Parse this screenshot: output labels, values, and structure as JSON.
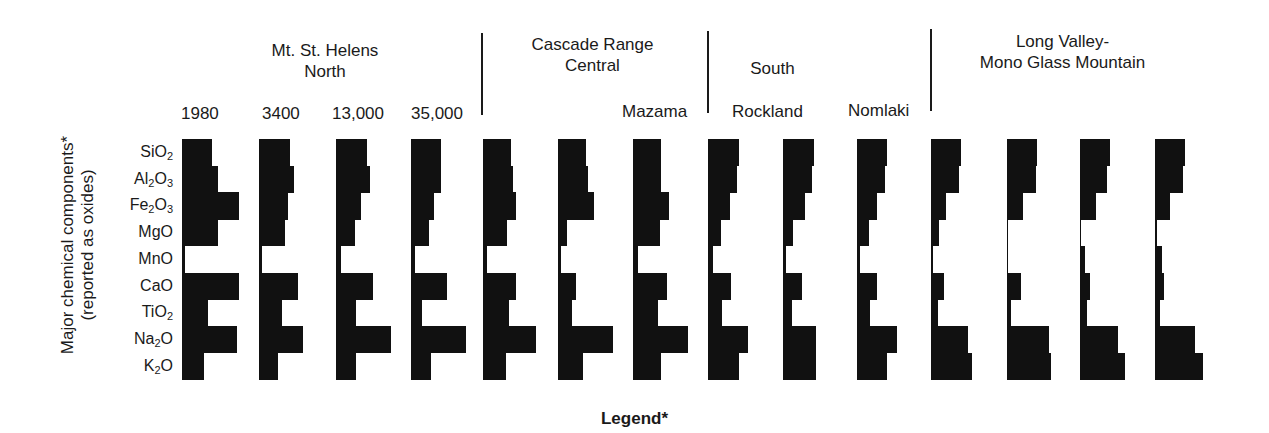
{
  "chart_data": {
    "type": "bar",
    "subtype": "profile-glyphs (horizontal bars per sample)",
    "title": "",
    "ylabel": "Major chemical components* (reported as oxides)",
    "legend_title": "Legend*",
    "categories": [
      "SiO2",
      "Al2O3",
      "Fe2O3",
      "MgO",
      "MnO",
      "CaO",
      "TiO2",
      "Na2O",
      "K2O"
    ],
    "category_labels": [
      {
        "base": "SiO",
        "sub": "2",
        "tail": ""
      },
      {
        "base": "Al",
        "sub": "2",
        "tail": "O3"
      },
      {
        "base": "Fe",
        "sub": "2",
        "tail": "O3"
      },
      {
        "base": "MgO",
        "sub": "",
        "tail": ""
      },
      {
        "base": "MnO",
        "sub": "",
        "tail": ""
      },
      {
        "base": "CaO",
        "sub": "",
        "tail": ""
      },
      {
        "base": "TiO",
        "sub": "2",
        "tail": ""
      },
      {
        "base": "Na",
        "sub": "2",
        "tail": "O"
      },
      {
        "base": "K",
        "sub": "2",
        "tail": "O"
      }
    ],
    "units": "relative bar length (px, unlabeled scale)",
    "groups": [
      {
        "name": "Mt. St. Helens\nNorth",
        "samples": [
          0,
          1,
          2,
          3
        ]
      },
      {
        "name": "Cascade Range\nCentral",
        "samples": [
          4,
          5,
          6
        ]
      },
      {
        "name": "South",
        "samples": [
          7,
          8,
          9
        ]
      },
      {
        "name": "Long Valley-\nMono Glass Mountain",
        "samples": [
          10,
          11,
          12,
          13
        ]
      }
    ],
    "series": [
      {
        "name": "1980",
        "values": [
          30,
          36,
          57,
          36,
          3,
          57,
          26,
          55,
          22
        ]
      },
      {
        "name": "3400",
        "values": [
          31,
          35,
          29,
          26,
          3,
          39,
          23,
          44,
          19
        ]
      },
      {
        "name": "13,000",
        "values": [
          31,
          34,
          25,
          19,
          5,
          37,
          20,
          55,
          20
        ]
      },
      {
        "name": "35,000",
        "values": [
          30,
          30,
          23,
          18,
          4,
          36,
          11,
          55,
          20
        ]
      },
      {
        "name": "",
        "values": [
          28,
          30,
          33,
          24,
          4,
          33,
          26,
          53,
          23
        ]
      },
      {
        "name": "",
        "values": [
          28,
          30,
          36,
          9,
          3,
          18,
          14,
          55,
          25
        ]
      },
      {
        "name": "Mazama",
        "values": [
          28,
          28,
          36,
          27,
          5,
          34,
          25,
          55,
          28
        ]
      },
      {
        "name": "Rockland",
        "values": [
          31,
          29,
          22,
          13,
          5,
          23,
          14,
          40,
          31
        ]
      },
      {
        "name": "",
        "values": [
          31,
          29,
          22,
          10,
          3,
          19,
          9,
          33,
          33
        ]
      },
      {
        "name": "Nomlaki",
        "values": [
          30,
          28,
          20,
          12,
          3,
          20,
          13,
          40,
          30
        ]
      },
      {
        "name": "",
        "values": [
          30,
          28,
          15,
          8,
          2,
          13,
          7,
          37,
          41
        ]
      },
      {
        "name": "",
        "values": [
          30,
          29,
          16,
          1,
          1,
          14,
          4,
          42,
          44
        ]
      },
      {
        "name": "",
        "values": [
          30,
          27,
          16,
          1,
          5,
          10,
          7,
          38,
          45
        ]
      },
      {
        "name": "",
        "values": [
          30,
          28,
          15,
          2,
          7,
          9,
          5,
          40,
          48
        ]
      }
    ],
    "grid": false,
    "legend_position": "bottom"
  },
  "header": {
    "groups": [
      {
        "title": "Mt. St. Helens\nNorth"
      },
      {
        "title": "Cascade Range\nCentral"
      },
      {
        "title": "South"
      },
      {
        "title": "Long Valley-\nMono Glass Mountain"
      }
    ],
    "sample_labels": [
      "1980",
      "3400",
      "13,000",
      "35,000",
      "Mazama",
      "Rockland",
      "Nomlaki"
    ]
  },
  "axis": {
    "y_title": "Major chemical components*\n(reported as oxides)"
  },
  "legend": {
    "title": "Legend*"
  }
}
